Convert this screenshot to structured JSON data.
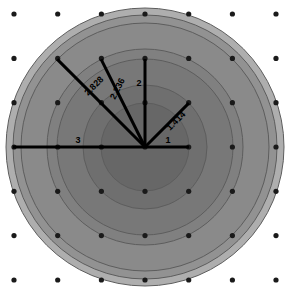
{
  "figure": {
    "canvas": {
      "width": 287,
      "height": 294,
      "background": "#ffffff"
    },
    "center": {
      "x": 145,
      "y": 147
    },
    "scale_px_per_unit": 44,
    "lattice": {
      "dot_color": "#1a1a1a",
      "dot_radius_px": 2.6,
      "origin": {
        "x": 14,
        "y": 14
      },
      "spacing_px": 43.7,
      "columns": 7,
      "rows": 7,
      "x_positions": [
        14,
        57.7,
        101.4,
        145,
        188.7,
        232.4,
        276
      ],
      "y_positions": [
        14,
        58.4,
        102.7,
        147,
        191.3,
        235.6,
        280
      ]
    }
  },
  "chart_data": {
    "type": "scatter",
    "subtitle": "",
    "xlabel": "",
    "ylabel": "",
    "xlim": [
      -3,
      3
    ],
    "ylim": [
      -3,
      3
    ],
    "grid": false,
    "legend": "none",
    "rings": [
      {
        "label": "1",
        "radius": 1,
        "radius_px": 44,
        "fill": "#676767",
        "stroke": "#5d5d5d"
      },
      {
        "label": "1.414",
        "radius": 1.414,
        "radius_px": 62,
        "fill": "#6f6f6f",
        "stroke": "#5d5d5d"
      },
      {
        "label": "2",
        "radius": 2,
        "radius_px": 88,
        "fill": "#787878",
        "stroke": "#5d5d5d"
      },
      {
        "label": "2.236",
        "radius": 2.236,
        "radius_px": 98,
        "fill": "#808080",
        "stroke": "#5d5d5d"
      },
      {
        "label": "2.828",
        "radius": 2.828,
        "radius_px": 124,
        "fill": "#8a8a8a",
        "stroke": "#5d5d5d"
      },
      {
        "label": "3",
        "radius": 3,
        "radius_px": 132,
        "fill": "#929292",
        "stroke": "#5d5d5d"
      },
      {
        "label": "3.162",
        "radius": 3.162,
        "radius_px": 139,
        "fill": "#aeaeae",
        "stroke": "#9a9a9a"
      }
    ],
    "radii_lines": [
      {
        "label": "1",
        "value": 1,
        "point": [
          1,
          0
        ],
        "length_px": 44,
        "angle_deg": 0
      },
      {
        "label": "1.414",
        "value": 1.414,
        "point": [
          1,
          1
        ],
        "length_px": 62,
        "angle_deg": 45
      },
      {
        "label": "2",
        "value": 2,
        "point": [
          0,
          2
        ],
        "length_px": 88,
        "angle_deg": 90
      },
      {
        "label": "2.236",
        "value": 2.236,
        "point": [
          -1,
          2
        ],
        "length_px": 98,
        "angle_deg": 116.57
      },
      {
        "label": "2.828",
        "value": 2.828,
        "point": [
          -2,
          2
        ],
        "length_px": 124,
        "angle_deg": 135
      },
      {
        "label": "3",
        "value": 3,
        "point": [
          -3,
          0
        ],
        "length_px": 132,
        "angle_deg": 180
      }
    ],
    "labels": [
      {
        "text": "1",
        "x": 168,
        "y": 143,
        "rotate": 0
      },
      {
        "text": "1.414",
        "x": 178,
        "y": 123,
        "rotate": -45
      },
      {
        "text": "2",
        "x": 139,
        "y": 86,
        "rotate": 0
      },
      {
        "text": "2.236",
        "x": 120,
        "y": 90,
        "rotate": -63
      },
      {
        "text": "2.828",
        "x": 96,
        "y": 88,
        "rotate": -45
      },
      {
        "text": "3",
        "x": 78,
        "y": 143,
        "rotate": 0
      }
    ],
    "values": [
      1,
      1.414,
      2,
      2.236,
      2.828,
      3
    ],
    "categories": [
      "1",
      "1.414",
      "2",
      "2.236",
      "2.828",
      "3"
    ]
  }
}
